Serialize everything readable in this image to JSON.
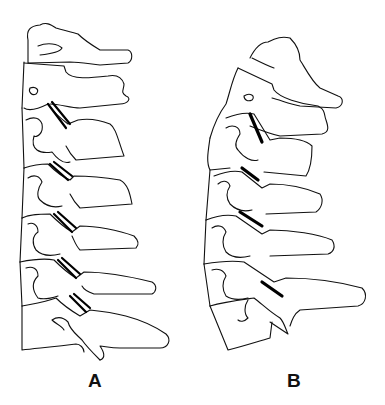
{
  "figure": {
    "type": "line-drawing",
    "panels": [
      {
        "id": "A",
        "label": "A",
        "description": "straightened cervical spine with parallel double-line facet joints",
        "facet_joint_count": 5
      },
      {
        "id": "B",
        "label": "B",
        "description": "lordotic (curved) cervical spine with single thick facet joint lines",
        "facet_joint_count": 4
      }
    ],
    "colors": {
      "background": "#ffffff",
      "line": "#111111",
      "facet": "#000000"
    }
  }
}
